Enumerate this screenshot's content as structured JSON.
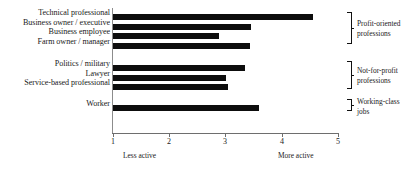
{
  "chart_data": {
    "type": "bar",
    "orientation": "horizontal",
    "title": "",
    "xlabel": "",
    "ylabel": "",
    "xlim": [
      1,
      5
    ],
    "xticks": [
      1,
      2,
      3,
      4,
      5
    ],
    "xtick_labels": [
      "1",
      "2",
      "3",
      "4",
      "5"
    ],
    "grid": false,
    "legend": false,
    "bar_color": "#0d0d0d",
    "axis_color": "#6e6e6e",
    "axis_low_caption": "Less active",
    "axis_high_caption": "More active",
    "categories": [
      "Technical professional",
      "Business owner / executive",
      "Business employee",
      "Farm owner / manager",
      "Politics / military",
      "Lawyer",
      "Service-based professional",
      "Worker"
    ],
    "values": [
      4.55,
      3.45,
      2.88,
      3.43,
      3.35,
      3.0,
      3.04,
      3.6
    ],
    "groups": [
      {
        "label_line1": "Profit-oriented",
        "label_line2": "professions",
        "members": [
          "Technical professional",
          "Business owner / executive",
          "Business employee",
          "Farm owner / manager"
        ]
      },
      {
        "label_line1": "Not-for-profit",
        "label_line2": "professions",
        "members": [
          "Politics / military",
          "Lawyer",
          "Service-based professional"
        ]
      },
      {
        "label_line1": "Working-class",
        "label_line2": "jobs",
        "members": [
          "Worker"
        ]
      }
    ]
  },
  "axis": {
    "ticks": [
      "1",
      "2",
      "3",
      "4",
      "5"
    ],
    "low_caption": "Less active",
    "high_caption": "More active"
  },
  "bars": [
    {
      "label": "Technical professional",
      "value": 4.55
    },
    {
      "label": "Business owner / executive",
      "value": 3.45
    },
    {
      "label": "Business employee",
      "value": 2.88
    },
    {
      "label": "Farm owner / manager",
      "value": 3.43
    },
    {
      "label": "Politics / military",
      "value": 3.35
    },
    {
      "label": "Lawyer",
      "value": 3.0
    },
    {
      "label": "Service-based professional",
      "value": 3.04
    },
    {
      "label": "Worker",
      "value": 3.6
    }
  ],
  "groups": [
    {
      "line1": "Profit-oriented",
      "line2": "professions"
    },
    {
      "line1": "Not-for-profit",
      "line2": "professions"
    },
    {
      "line1": "Working-class",
      "line2": "jobs"
    }
  ]
}
